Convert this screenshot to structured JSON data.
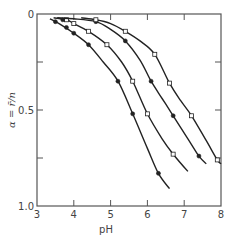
{
  "chart_data": {
    "type": "line",
    "title": "",
    "xlabel": "pH",
    "ylabel": "α = r̄/n",
    "xlim": [
      3,
      8
    ],
    "ylim": [
      0,
      1.0
    ],
    "y_inverted": true,
    "grid": false,
    "legend": null,
    "x_ticks": [
      3,
      4,
      5,
      6,
      7,
      8
    ],
    "x_tick_labels": [
      "3",
      "4",
      "5",
      "6",
      "7",
      "8"
    ],
    "y_ticks": [
      0,
      0.25,
      0.5,
      0.75,
      1.0
    ],
    "y_tick_labels": [
      "0",
      "",
      "0.5",
      "",
      "1.0"
    ],
    "series": [
      {
        "name": "curve-1",
        "marker": "filled",
        "curve": [
          [
            3.35,
            0.025
          ],
          [
            3.6,
            0.05
          ],
          [
            4.0,
            0.1
          ],
          [
            4.4,
            0.16
          ],
          [
            4.8,
            0.25
          ],
          [
            5.2,
            0.35
          ],
          [
            5.6,
            0.52
          ],
          [
            6.0,
            0.7
          ],
          [
            6.3,
            0.83
          ],
          [
            6.6,
            0.91
          ]
        ],
        "points": [
          [
            3.5,
            0.04
          ],
          [
            3.8,
            0.07
          ],
          [
            4.0,
            0.1
          ],
          [
            4.4,
            0.16
          ],
          [
            5.2,
            0.35
          ],
          [
            5.6,
            0.52
          ],
          [
            6.3,
            0.83
          ]
        ]
      },
      {
        "name": "curve-2",
        "marker": "open",
        "curve": [
          [
            3.45,
            0.02
          ],
          [
            3.8,
            0.03
          ],
          [
            4.0,
            0.05
          ],
          [
            4.4,
            0.09
          ],
          [
            4.9,
            0.16
          ],
          [
            5.3,
            0.25
          ],
          [
            5.6,
            0.35
          ],
          [
            6.0,
            0.52
          ],
          [
            6.4,
            0.65
          ],
          [
            6.7,
            0.73
          ],
          [
            7.1,
            0.82
          ]
        ],
        "points": [
          [
            3.8,
            0.03
          ],
          [
            4.0,
            0.05
          ],
          [
            4.4,
            0.09
          ],
          [
            4.9,
            0.16
          ],
          [
            5.6,
            0.35
          ],
          [
            6.0,
            0.52
          ],
          [
            6.7,
            0.73
          ]
        ]
      },
      {
        "name": "curve-3",
        "marker": "filled",
        "curve": [
          [
            3.55,
            0.02
          ],
          [
            4.0,
            0.025
          ],
          [
            4.6,
            0.04
          ],
          [
            5.0,
            0.08
          ],
          [
            5.4,
            0.14
          ],
          [
            5.8,
            0.24
          ],
          [
            6.1,
            0.35
          ],
          [
            6.4,
            0.44
          ],
          [
            6.7,
            0.53
          ],
          [
            7.1,
            0.65
          ],
          [
            7.4,
            0.74
          ],
          [
            7.6,
            0.78
          ]
        ],
        "points": [
          [
            3.7,
            0.03
          ],
          [
            4.6,
            0.04
          ],
          [
            5.4,
            0.14
          ],
          [
            6.1,
            0.35
          ],
          [
            6.7,
            0.53
          ],
          [
            7.4,
            0.74
          ]
        ]
      },
      {
        "name": "curve-4",
        "marker": "open",
        "curve": [
          [
            4.2,
            0.02
          ],
          [
            4.6,
            0.03
          ],
          [
            5.0,
            0.05
          ],
          [
            5.4,
            0.09
          ],
          [
            5.8,
            0.14
          ],
          [
            6.2,
            0.21
          ],
          [
            6.6,
            0.36
          ],
          [
            6.9,
            0.45
          ],
          [
            7.2,
            0.53
          ],
          [
            7.6,
            0.66
          ],
          [
            7.9,
            0.76
          ],
          [
            8.0,
            0.78
          ]
        ],
        "points": [
          [
            4.6,
            0.03
          ],
          [
            5.4,
            0.09
          ],
          [
            6.2,
            0.21
          ],
          [
            6.6,
            0.36
          ],
          [
            7.2,
            0.53
          ],
          [
            7.9,
            0.76
          ]
        ]
      }
    ]
  },
  "colors": {
    "line": "#222222",
    "axis": "#555555",
    "text": "#444444",
    "marker_fill_filled": "#222222",
    "marker_fill_open": "#ffffff"
  },
  "frame": {
    "left": 37,
    "top": 14,
    "right": 221,
    "bottom": 206
  }
}
